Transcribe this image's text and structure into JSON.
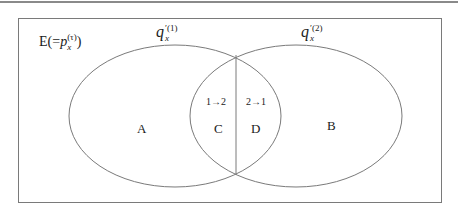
{
  "diagram": {
    "type": "venn",
    "universe_label": {
      "prefix": "E(",
      "equals": "=",
      "symbol": "p",
      "subscript": "x",
      "superscript": "(τ)",
      "suffix": ")"
    },
    "sets": [
      {
        "id": "set1",
        "symbol": "q",
        "prime": "′",
        "superscript": "(1)",
        "subscript": "x"
      },
      {
        "id": "set2",
        "symbol": "q",
        "prime": "′",
        "superscript": "(2)",
        "subscript": "x"
      }
    ],
    "regions": {
      "A": "A",
      "B": "B",
      "C": "C",
      "D": "D"
    },
    "transitions": {
      "c": "1→2",
      "d": "2→1"
    },
    "colors": {
      "stroke": "#7a7a7a",
      "text": "#1a1a1a",
      "background": "#ffffff"
    }
  }
}
